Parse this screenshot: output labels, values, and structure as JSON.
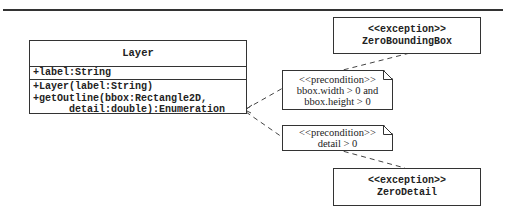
{
  "layer_class": {
    "name": "Layer",
    "attributes": [
      "+label:String"
    ],
    "operations": [
      "+Layer(label:String)",
      "+getOutline(bbox:Rectangle2D,",
      "      detail:double):Enumeration"
    ]
  },
  "exceptions": [
    {
      "stereotype": "<<exception>>",
      "name": "ZeroBoundingBox"
    },
    {
      "stereotype": "<<exception>>",
      "name": "ZeroDetail"
    }
  ],
  "notes": [
    {
      "stereotype": "<<precondition>>",
      "lines": [
        "bbox.width > 0 and",
        "bbox.height > 0"
      ]
    },
    {
      "stereotype": "<<precondition>>",
      "lines": [
        "detail > 0"
      ]
    }
  ]
}
